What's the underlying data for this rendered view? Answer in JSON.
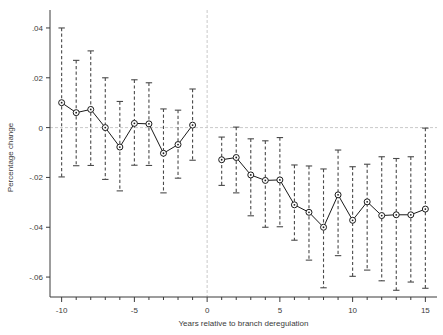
{
  "chart_data": {
    "type": "scatter",
    "title": "",
    "subtitle": "",
    "xlabel": "Years relative to branch deregulation",
    "ylabel": "Percentage change",
    "xlim": [
      -10.8,
      15.8
    ],
    "ylim": [
      -0.068,
      0.044
    ],
    "xticks": [
      -10,
      -5,
      0,
      5,
      10,
      15
    ],
    "xtick_labels": [
      "-10",
      "-5",
      "0",
      "5",
      "10",
      "15"
    ],
    "yticks": [
      0.04,
      0.02,
      0,
      -0.02,
      -0.04,
      -0.06
    ],
    "ytick_labels": [
      ".04",
      ".02",
      "0",
      "-.02",
      "-.04",
      "-.06"
    ],
    "grid": false,
    "zero_line": true,
    "event_line_x": 0,
    "omitted_period": 0,
    "legend": null,
    "error_bar_style": "dashed-capped",
    "marker": "open-circle",
    "series": [
      {
        "name": "Percentage change",
        "x": [
          -10,
          -9,
          -8,
          -7,
          -6,
          -5,
          -4,
          -3,
          -2,
          -1,
          1,
          2,
          3,
          4,
          5,
          6,
          7,
          8,
          9,
          10,
          11,
          12,
          13,
          14,
          15
        ],
        "values": [
          0.01,
          0.006,
          0.0073,
          0.0,
          -0.0078,
          0.0017,
          0.0015,
          -0.0103,
          -0.0068,
          0.001,
          -0.0129,
          -0.012,
          -0.019,
          -0.0212,
          -0.021,
          -0.031,
          -0.034,
          -0.04,
          -0.027,
          -0.0372,
          -0.0298,
          -0.0353,
          -0.035,
          -0.035,
          -0.0327
        ],
        "ci_low": [
          -0.0198,
          -0.0153,
          -0.0152,
          -0.0208,
          -0.0254,
          -0.0151,
          -0.0152,
          -0.0262,
          -0.0203,
          -0.0131,
          -0.0232,
          -0.0262,
          -0.0354,
          -0.04,
          -0.0398,
          -0.0452,
          -0.0532,
          -0.0643,
          -0.0514,
          -0.0597,
          -0.0572,
          -0.0615,
          -0.0653,
          -0.062,
          -0.0645
        ],
        "ci_high": [
          0.04,
          0.027,
          0.0308,
          0.02,
          0.0105,
          0.0192,
          0.018,
          0.0075,
          0.007,
          0.0155,
          -0.0038,
          0.0002,
          -0.0045,
          -0.0053,
          -0.004,
          -0.015,
          -0.0154,
          -0.0166,
          -0.009,
          -0.0157,
          -0.0147,
          -0.0117,
          -0.0124,
          -0.0117,
          -0.0002
        ]
      }
    ]
  },
  "colors": {
    "axis": "#3b3b3b",
    "marker": "#1a1a1a",
    "line": "#1a1a1a",
    "errorbar": "#4a4a4a",
    "zero_line": "#c9c9c9",
    "event_line": "#c9c9c9",
    "background": "#ffffff"
  }
}
